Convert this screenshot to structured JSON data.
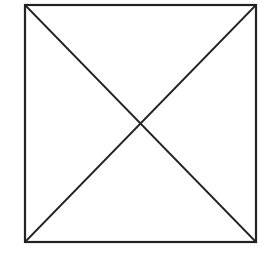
{
  "diagram": {
    "type": "square-with-diagonals",
    "stroke_color": "#222222",
    "background_color": "#ffffff",
    "square": {
      "x": 24,
      "y": 4,
      "width": 233,
      "height": 239
    },
    "diagonals": [
      {
        "from": "top-left",
        "to": "bottom-right"
      },
      {
        "from": "top-right",
        "to": "bottom-left"
      }
    ]
  }
}
